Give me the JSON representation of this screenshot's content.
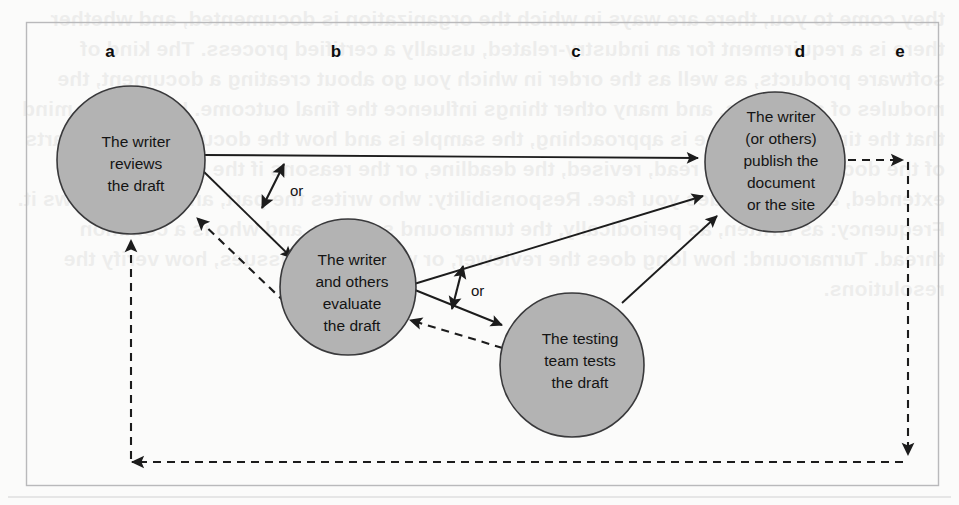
{
  "figure": {
    "type": "flow-diagram",
    "background_color": "#fbfbfa",
    "node_fill_color": "#b3b3b3",
    "node_stroke_color": "#39393b",
    "edge_color": "#1c1c1c",
    "frame_color": "#b9b9bb"
  },
  "column_labels": [
    {
      "id": "a",
      "text": "a",
      "x": 110,
      "y": 57
    },
    {
      "id": "b",
      "text": "b",
      "x": 336,
      "y": 57
    },
    {
      "id": "c",
      "text": "c",
      "x": 576,
      "y": 57
    },
    {
      "id": "d",
      "text": "d",
      "x": 800,
      "y": 57
    },
    {
      "id": "e",
      "text": "e",
      "x": 900,
      "y": 57
    }
  ],
  "nodes": [
    {
      "id": "a",
      "name": "writer-reviews-draft",
      "cx": 131,
      "cy": 160,
      "r": 74,
      "lines": [
        "The writer",
        "reviews",
        "the draft"
      ]
    },
    {
      "id": "b",
      "name": "writer-and-others-evaluate-draft",
      "cx": 348,
      "cy": 287,
      "r": 68,
      "lines": [
        "The writer",
        "and others",
        "evaluate",
        "the draft"
      ]
    },
    {
      "id": "c",
      "name": "testing-team-tests-draft",
      "cx": 572,
      "cy": 365,
      "r": 72,
      "lines": [
        "The testing",
        "team tests",
        "the draft"
      ]
    },
    {
      "id": "d",
      "name": "writer-or-others-publish",
      "cx": 775,
      "cy": 162,
      "r": 70,
      "lines": [
        "The writer",
        "(or others)",
        "publish the",
        "document",
        "or the site"
      ]
    }
  ],
  "or_labels": [
    {
      "text": "or",
      "x": 290,
      "y": 196
    },
    {
      "text": "or",
      "x": 471,
      "y": 296
    }
  ],
  "edges": [
    {
      "name": "a-to-d-publish",
      "style": "solid",
      "from": "a",
      "to": "d",
      "arrow": "end"
    },
    {
      "name": "a-to-b-evaluate",
      "style": "solid",
      "from": "a",
      "to": "b",
      "arrow": "end"
    },
    {
      "name": "a-branch-or-fork",
      "style": "solid",
      "arrow": "both"
    },
    {
      "name": "b-to-d-publish",
      "style": "solid",
      "from": "b",
      "to": "d",
      "arrow": "end"
    },
    {
      "name": "b-to-c-test",
      "style": "solid",
      "from": "b",
      "to": "c",
      "arrow": "end"
    },
    {
      "name": "b-branch-or-fork",
      "style": "solid",
      "arrow": "both"
    },
    {
      "name": "c-to-d-publish",
      "style": "solid",
      "from": "c",
      "to": "d",
      "arrow": "end"
    },
    {
      "name": "b-back-to-a",
      "style": "dashed",
      "from": "b",
      "to": "a",
      "arrow": "end"
    },
    {
      "name": "c-back-to-b",
      "style": "dashed",
      "from": "c",
      "to": "b",
      "arrow": "end"
    },
    {
      "name": "d-to-e",
      "style": "dashed",
      "from": "d",
      "to": "e",
      "arrow": "end"
    },
    {
      "name": "e-loop-down",
      "style": "dashed",
      "arrow": "end"
    },
    {
      "name": "e-loop-back-to-a",
      "style": "dashed",
      "to": "a",
      "arrow": "end"
    }
  ],
  "bleed_through_text": "they come to you, there are ways in which the organization is documented, and whether there is a requirement for an industry-related, usually a certified process. The kind of software products, as well as the order in which you go about creating a document, the modules of a process, and many other things influence the final outcome. Keeping in mind that the time a milestone is approaching, the sample is and how the document or the parts of the document can be read, revised, the deadline, or the reasons if the deadline is extended, are also issues you face. Responsibility: who writes the part, and who reviews it. Frequency: as written, as periodically, the turnaround severity, and who is a common thread. Turnaround: how long does the reviewer, or what are the issues, how verify the resolutions."
}
